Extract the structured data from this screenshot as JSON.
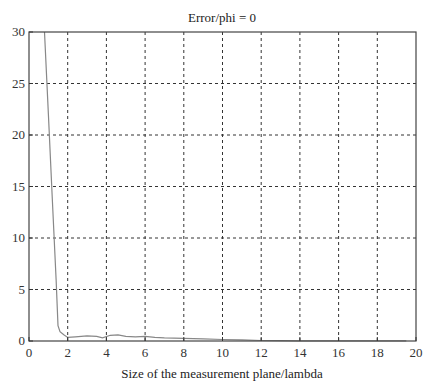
{
  "chart_data": {
    "type": "line",
    "title": "Error/phi = 0",
    "xlabel": "Size of the measurement plane/lambda",
    "ylabel": "",
    "xlim": [
      0,
      20
    ],
    "ylim": [
      0,
      30
    ],
    "xticks": [
      0,
      2,
      4,
      6,
      8,
      10,
      12,
      14,
      16,
      18,
      20
    ],
    "yticks": [
      0,
      5,
      10,
      15,
      20,
      25,
      30
    ],
    "grid": true,
    "grid_style": "dashed",
    "legend": null,
    "series": [
      {
        "name": "Error",
        "color": "#888888",
        "x": [
          0.8,
          1.0,
          1.2,
          1.4,
          1.5,
          1.6,
          1.8,
          2.0,
          2.4,
          3.0,
          3.5,
          3.8,
          4.2,
          4.6,
          5.0,
          5.5,
          6.0,
          6.5,
          7.0,
          8.0,
          9.0,
          10.0,
          11.0,
          12.0,
          13.0,
          14.0,
          16.0,
          18.0,
          19.5
        ],
        "y": [
          30.0,
          22.0,
          14.0,
          6.0,
          1.5,
          0.9,
          0.6,
          0.35,
          0.4,
          0.5,
          0.45,
          0.3,
          0.55,
          0.6,
          0.45,
          0.4,
          0.45,
          0.35,
          0.3,
          0.25,
          0.2,
          0.15,
          0.12,
          0.05,
          0.03,
          0.02,
          0.02,
          0.02,
          0.02
        ]
      }
    ]
  }
}
